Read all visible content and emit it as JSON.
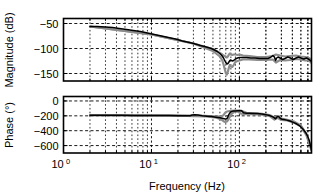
{
  "figure": {
    "type": "bode-plot",
    "background": "#ffffff",
    "line_color": "#000000",
    "band_color": "#8c8c8c",
    "grid_color": "#000000"
  },
  "chart_data": [
    {
      "type": "line",
      "id": "magnitude",
      "title": "",
      "xlabel": "",
      "ylabel": "Magnitude (dB)",
      "xscale": "log",
      "xlim": [
        1,
        660
      ],
      "ylim": [
        -165,
        -40
      ],
      "yticks": [
        -50,
        -100,
        -150
      ],
      "ytick_labels": [
        "-50",
        "-100",
        "-150"
      ],
      "xticks": [
        1,
        10,
        100
      ],
      "xtick_labels": [
        "10",
        "10",
        "10"
      ],
      "xtick_exponents": [
        "0",
        "1",
        "2"
      ],
      "grid": true,
      "grid_style": "dashed",
      "legend": "none",
      "series": [
        {
          "name": "measured frequency response (mean)",
          "color": "#000000",
          "x": [
            2.0,
            2.4,
            3.0,
            3.6,
            4.3,
            5.2,
            6.2,
            7.5,
            9.0,
            10.8,
            13.0,
            15.6,
            18.8,
            22.5,
            27.0,
            30.0,
            33.0,
            36.0,
            40.0,
            44.0,
            48.0,
            52.0,
            56.0,
            60.0,
            63.0,
            66.0,
            68.0,
            70.0,
            72.0,
            74.0,
            76.0,
            78.0,
            80.0,
            83.0,
            86.0,
            90.0,
            95.0,
            100.0,
            110.0,
            120.0,
            135.0,
            150.0,
            170.0,
            190.0,
            210.0,
            225.0,
            240.0,
            250.0,
            258.0,
            265.0,
            275.0,
            290.0,
            310.0,
            330.0,
            355.0,
            380.0,
            410.0,
            440.0,
            470.0,
            500.0,
            540.0,
            580.0,
            620.0,
            660.0
          ],
          "y": [
            -56,
            -56,
            -57,
            -58,
            -60,
            -62,
            -64,
            -66,
            -69,
            -72,
            -75,
            -78,
            -81,
            -85,
            -88,
            -90,
            -92,
            -94,
            -96,
            -98,
            -100,
            -103,
            -106,
            -110,
            -114,
            -119,
            -124,
            -128,
            -131,
            -130,
            -127,
            -124,
            -123,
            -125,
            -124,
            -121,
            -119,
            -118,
            -118,
            -118,
            -119,
            -119,
            -120,
            -120,
            -120,
            -118,
            -114,
            -117,
            -124,
            -119,
            -117,
            -119,
            -122,
            -120,
            -117,
            -119,
            -122,
            -119,
            -117,
            -119,
            -121,
            -119,
            -122,
            -126
          ]
        },
        {
          "name": "uncertainty band upper",
          "color": "#8c8c8c",
          "x": [
            2.0,
            10.0,
            30.0,
            50.0,
            60.0,
            64.0,
            66.0,
            68.0,
            70.0,
            72.0,
            74.0,
            76.0,
            78.0,
            80.0,
            83.0,
            86.0,
            90.0,
            95.0,
            100.0,
            110.0,
            130.0,
            160.0,
            200.0,
            240.0,
            260.0,
            290.0,
            330.0,
            380.0,
            440.0,
            500.0,
            560.0,
            620.0,
            660.0
          ],
          "y": [
            -56,
            -72,
            -90,
            -101,
            -109,
            -112,
            -114,
            -115,
            -116,
            -118,
            -116,
            -112,
            -110,
            -112,
            -113,
            -112,
            -112,
            -113,
            -112,
            -114,
            -115,
            -117,
            -117,
            -115,
            -112,
            -114,
            -116,
            -115,
            -114,
            -116,
            -117,
            -119,
            -123
          ]
        },
        {
          "name": "uncertainty band lower",
          "color": "#8c8c8c",
          "x": [
            2.0,
            10.0,
            30.0,
            50.0,
            60.0,
            64.0,
            66.0,
            68.0,
            70.0,
            72.0,
            74.0,
            76.0,
            78.0,
            80.0,
            83.0,
            86.0,
            90.0,
            95.0,
            100.0,
            110.0,
            130.0,
            160.0,
            200.0,
            240.0,
            260.0,
            290.0,
            330.0,
            380.0,
            440.0,
            500.0,
            560.0,
            620.0,
            660.0
          ],
          "y": [
            -56,
            -72,
            -90,
            -105,
            -116,
            -124,
            -132,
            -141,
            -149,
            -152,
            -146,
            -138,
            -133,
            -136,
            -137,
            -133,
            -127,
            -125,
            -124,
            -122,
            -122,
            -123,
            -123,
            -122,
            -128,
            -123,
            -124,
            -123,
            -121,
            -122,
            -124,
            -124,
            -129
          ]
        }
      ]
    },
    {
      "type": "line",
      "id": "phase",
      "title": "",
      "xlabel": "Frequency (Hz)",
      "ylabel": "Phase (°)",
      "xscale": "log",
      "xlim": [
        1,
        660
      ],
      "ylim": [
        -700,
        60
      ],
      "yticks": [
        0,
        -200,
        -400,
        -600
      ],
      "ytick_labels": [
        "0",
        "-200",
        "-400",
        "-600"
      ],
      "xticks": [
        1,
        10,
        100
      ],
      "xtick_labels": [
        "10",
        "10",
        "10"
      ],
      "xtick_exponents": [
        "0",
        "1",
        "2"
      ],
      "grid": true,
      "grid_style": "dashed",
      "legend": "none",
      "series": [
        {
          "name": "measured phase (mean)",
          "color": "#000000",
          "x": [
            2.0,
            3.0,
            4.5,
            6.5,
            9.0,
            12.0,
            16.0,
            20.0,
            24.0,
            26.0,
            27.5,
            29.0,
            31.0,
            34.0,
            38.0,
            43.0,
            48.0,
            54.0,
            60.0,
            64.0,
            67.0,
            70.0,
            73.0,
            76.0,
            79.0,
            82.0,
            86.0,
            90.0,
            95.0,
            100.0,
            106.0,
            112.0,
            120.0,
            130.0,
            145.0,
            160.0,
            180.0,
            200.0,
            220.0,
            240.0,
            250.0,
            258.0,
            266.0,
            274.0,
            282.0,
            292.0,
            305.0,
            320.0,
            345.0,
            375.0,
            410.0,
            450.0,
            490.0,
            530.0,
            570.0,
            600.0,
            625.0,
            645.0,
            660.0
          ],
          "y": [
            -192,
            -193,
            -193,
            -194,
            -195,
            -196,
            -197,
            -198,
            -199,
            -200,
            -198,
            -190,
            -186,
            -190,
            -198,
            -204,
            -210,
            -218,
            -226,
            -232,
            -238,
            -244,
            -230,
            -180,
            -150,
            -140,
            -136,
            -134,
            -133,
            -132,
            -133,
            -160,
            -166,
            -166,
            -168,
            -170,
            -176,
            -184,
            -196,
            -214,
            -228,
            -240,
            -218,
            -206,
            -214,
            -236,
            -246,
            -250,
            -258,
            -270,
            -288,
            -310,
            -340,
            -380,
            -430,
            -480,
            -540,
            -610,
            -660
          ]
        },
        {
          "name": "uncertainty band upper",
          "color": "#8c8c8c",
          "x": [
            2.0,
            20.0,
            40.0,
            55.0,
            62.0,
            66.0,
            69.0,
            72.0,
            75.0,
            78.0,
            82.0,
            88.0,
            95.0,
            105.0,
            120.0,
            145.0,
            180.0,
            220.0,
            250.0,
            270.0,
            300.0,
            350.0,
            420.0,
            500.0,
            580.0,
            660.0
          ],
          "y": [
            -192,
            -198,
            -200,
            -212,
            -208,
            -190,
            -158,
            -142,
            -138,
            -135,
            -133,
            -131,
            -130,
            -131,
            -160,
            -164,
            -172,
            -190,
            -222,
            -206,
            -238,
            -254,
            -278,
            -330,
            -450,
            -650
          ]
        },
        {
          "name": "uncertainty band lower",
          "color": "#8c8c8c",
          "x": [
            2.0,
            20.0,
            40.0,
            55.0,
            62.0,
            66.0,
            69.0,
            72.0,
            75.0,
            78.0,
            82.0,
            88.0,
            95.0,
            105.0,
            120.0,
            145.0,
            180.0,
            220.0,
            250.0,
            270.0,
            300.0,
            350.0,
            420.0,
            500.0,
            580.0,
            660.0
          ],
          "y": [
            -192,
            -198,
            -206,
            -226,
            -248,
            -272,
            -284,
            -276,
            -250,
            -210,
            -170,
            -144,
            -140,
            -172,
            -176,
            -176,
            -184,
            -202,
            -250,
            -226,
            -256,
            -262,
            -292,
            -342,
            -462,
            -668
          ]
        }
      ]
    }
  ]
}
